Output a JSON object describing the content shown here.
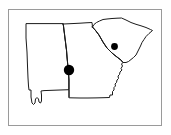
{
  "figure": {
    "kind": "region-map",
    "width": 171,
    "height": 135,
    "background_color": "#ffffff",
    "frame": {
      "visible": true,
      "color": "#9a9a9a",
      "x": 8,
      "y": 9,
      "width": 154,
      "height": 117
    }
  },
  "map": {
    "title": "",
    "projection_note": "",
    "outline_color": "#1a1a1a",
    "fill_color": "#ffffff",
    "regions": [
      {
        "id": "alabama",
        "name": "Alabama",
        "label": "",
        "path": "M 26 24 L 26 38 L 27 52 L 27.5 66 L 28 78 L 28.5 86 L 29 90 L 31 90 L 31 97 L 32 103 L 33.5 104.5 L 35 103 L 35.5 99 L 37 97.5 L 38.5 99 L 39 102 L 40.5 103 L 41.5 101 L 41.5 95 L 41 91 L 44 90.6 L 52 90.3 L 60 90 L 66 89.8 L 69 89.7 L 69 80 L 68.5 72 L 67.5 62 L 66.5 50 L 65 38 L 63.5 26 L 63.2 24 Z"
      },
      {
        "id": "georgia",
        "name": "Georgia",
        "label": "",
        "path": "M 63.2 24 L 72 23.6 L 80 23.2 L 86 22.8 L 92 22.5 L 92.5 27 L 96 31 L 99 35 L 103 42 L 107 48 L 112 53 L 117 57 L 121 60 L 123 62.5 L 121.5 64 L 122.5 66 L 121 68.5 L 122 70 L 120 72 L 119.5 74.5 L 118 76 L 118.5 78.5 L 117 80 L 116.5 82.5 L 115 84 L 115.5 86 L 114 87.5 L 114 90 L 112.5 91.5 L 112.5 95 L 110 95 L 109.5 97.5 L 104 97.7 L 96 97.9 L 88 98 L 80 98 L 74 97.9 L 69.5 97.8 L 69 97.5 L 69 89.7 L 69 80 L 68.5 72 L 67.5 62 L 66.5 50 L 65 38 L 63.5 26 Z"
      },
      {
        "id": "south-carolina",
        "name": "South Carolina",
        "label": "",
        "path": "M 92.5 27 L 94 24.5 L 96.5 22.5 L 99.5 21 L 103 19.5 L 107 19 L 112 18.5 L 117 18.2 L 121.5 18 L 126 20 L 131 22.5 L 136 24.3 L 141 25.8 L 146 27.5 L 150.5 29.5 L 152.5 30.5 L 149 33.5 L 146 36.5 L 144 39.5 L 142 42.5 L 140.5 46 L 139 49 L 137.5 52 L 136 55 L 133.5 57.5 L 131 59.5 L 128.5 61.5 L 126 62.5 L 124 62.5 L 123 62.5 L 121 60 L 117 57 L 112 53 L 107 48 L 103 42 L 99 35 L 96 31 L 92.5 27 Z"
      }
    ],
    "interior_borders": [
      {
        "id": "alabama-georgia-border",
        "name": "Alabama / Georgia state line",
        "path": "M 63.2 24 L 63.5 26 L 65 38 L 66.5 50 L 67.5 62 L 68.5 72 L 69 80 L 69 89.7 L 69 97.5"
      },
      {
        "id": "georgia-south-carolina-border",
        "name": "Georgia / South Carolina state line (Savannah River)",
        "path": "M 92.5 27 L 96 31 L 99 35 L 103 42 L 107 48 L 112 53 L 117 57 L 121 60 L 123 62.5"
      }
    ],
    "markers": [
      {
        "id": "marker-alabama-georgia",
        "name": "study-site-west",
        "label": "",
        "x": 69,
        "y": 70,
        "radius": 5.2,
        "color": "#000000",
        "shape": "filled-circle"
      },
      {
        "id": "marker-south-carolina",
        "name": "study-site-east",
        "label": "",
        "x": 114.5,
        "y": 46.5,
        "radius": 3.4,
        "color": "#000000",
        "shape": "filled-circle"
      }
    ]
  },
  "legend": {
    "visible": false,
    "entries": []
  },
  "caption": ""
}
